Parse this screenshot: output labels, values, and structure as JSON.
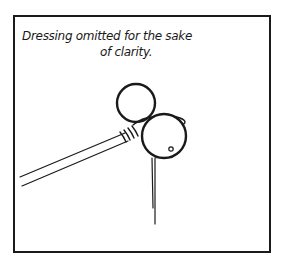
{
  "caption": {
    "line1": "Dressing omitted for the sake",
    "line2": "of clarity."
  },
  "illustration": {
    "subject": "fly-tying hook with two bead-like balls (eyes) lashed to a rod with thread",
    "stroke_color": "#1a1a1a",
    "background_color": "#ffffff"
  }
}
